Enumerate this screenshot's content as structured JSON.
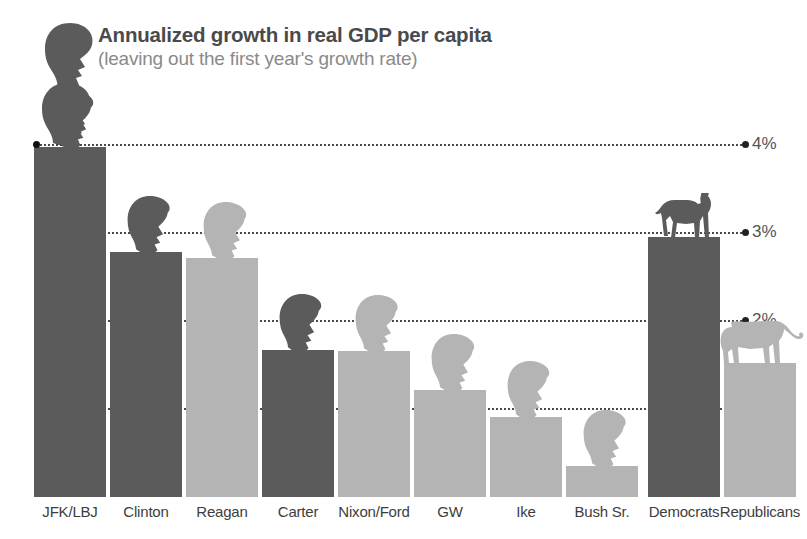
{
  "header": {
    "title": "Annualized growth in real GDP per capita",
    "subtitle": "(leaving out the first year's growth rate)"
  },
  "colors": {
    "dark_bar": "#5b5b5b",
    "light_bar": "#b4b4b4",
    "title_text": "#4a4a4a",
    "subtitle_text": "#8a8a8a",
    "gridline": "#2b2b2b",
    "background": "#ffffff"
  },
  "icons": {
    "democrat": "donkey-icon",
    "republican": "elephant-icon",
    "president": "president-head-icon"
  },
  "chart_data": {
    "type": "bar",
    "title": "Annualized growth in real GDP per capita",
    "subtitle": "(leaving out the first year's growth rate)",
    "xlabel": "",
    "ylabel": "",
    "ylim": [
      0,
      4.4
    ],
    "grid": true,
    "legend": "none",
    "yticks": [
      1,
      2,
      3,
      4
    ],
    "ytick_labels": [
      "1%",
      "2%",
      "3%",
      "4%"
    ],
    "categories": [
      "JFK/LBJ",
      "Clinton",
      "Reagan",
      "Carter",
      "Nixon/Ford",
      "GW",
      "Ike",
      "Bush Sr.",
      "Democrats",
      "Republicans"
    ],
    "values": [
      3.98,
      2.78,
      2.72,
      1.67,
      1.66,
      1.22,
      0.91,
      0.35,
      2.95,
      1.52
    ],
    "party": [
      "democrat",
      "democrat",
      "republican",
      "democrat",
      "republican",
      "republican",
      "republican",
      "republican",
      "democrat",
      "republican"
    ],
    "bar_colors": [
      "#5b5b5b",
      "#5b5b5b",
      "#b4b4b4",
      "#5b5b5b",
      "#b4b4b4",
      "#b4b4b4",
      "#b4b4b4",
      "#b4b4b4",
      "#5b5b5b",
      "#b4b4b4"
    ]
  }
}
